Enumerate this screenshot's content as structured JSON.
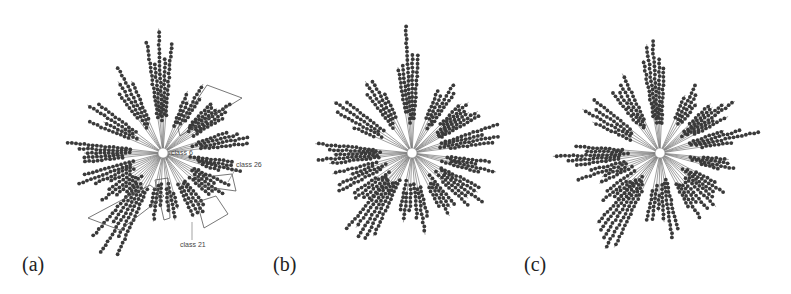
{
  "figure": {
    "panels": [
      {
        "id": "a",
        "label": "(a)",
        "center": [
          163,
          153
        ],
        "annotations": [
          {
            "text": "class 6",
            "x": 171,
            "y": 155
          },
          {
            "text": "class 26",
            "x": 236,
            "y": 167
          },
          {
            "text": "class 21",
            "x": 180,
            "y": 247
          }
        ],
        "highlight_boxes": [
          {
            "name": "box-upper-right",
            "points": "178,128 207,85 242,98 180,136"
          },
          {
            "name": "box-lower-left",
            "points": "88,218 150,185 164,196 120,230"
          },
          {
            "name": "box-class-26",
            "points": "196,178 232,174 236,191 200,186"
          },
          {
            "name": "box-class-21",
            "points": "197,202 216,196 228,214 204,228"
          },
          {
            "name": "box-middle",
            "points": "155,180 168,178 170,218 164,220"
          }
        ]
      },
      {
        "id": "b",
        "label": "(b)",
        "center": [
          412,
          153
        ],
        "annotations": [],
        "highlight_boxes": []
      },
      {
        "id": "c",
        "label": "(c)",
        "center": [
          660,
          153
        ],
        "annotations": [],
        "highlight_boxes": []
      }
    ],
    "tree": {
      "type": "radial-dendrogram",
      "node_color": "#3a3a3a",
      "edge_color": "#777777",
      "box_color": "#555555",
      "bundles": [
        {
          "angle": -92,
          "len": 128,
          "branches": 5,
          "spread": 8
        },
        {
          "angle": -62,
          "len": 88,
          "branches": 4,
          "spread": 8
        },
        {
          "angle": -120,
          "len": 100,
          "branches": 4,
          "spread": 8
        },
        {
          "angle": -38,
          "len": 92,
          "branches": 6,
          "spread": 10
        },
        {
          "angle": -12,
          "len": 102,
          "branches": 4,
          "spread": 7
        },
        {
          "angle": -150,
          "len": 100,
          "branches": 4,
          "spread": 9
        },
        {
          "angle": 180,
          "len": 108,
          "branches": 5,
          "spread": 8
        },
        {
          "angle": 158,
          "len": 92,
          "branches": 4,
          "spread": 8
        },
        {
          "angle": 12,
          "len": 88,
          "branches": 4,
          "spread": 6
        },
        {
          "angle": 34,
          "len": 92,
          "branches": 5,
          "spread": 10
        },
        {
          "angle": 58,
          "len": 88,
          "branches": 4,
          "spread": 8
        },
        {
          "angle": 80,
          "len": 88,
          "branches": 3,
          "spread": 6
        },
        {
          "angle": 98,
          "len": 82,
          "branches": 3,
          "spread": 6
        },
        {
          "angle": 122,
          "len": 126,
          "branches": 5,
          "spread": 10
        },
        {
          "angle": 140,
          "len": 80,
          "branches": 4,
          "spread": 8
        }
      ]
    }
  }
}
